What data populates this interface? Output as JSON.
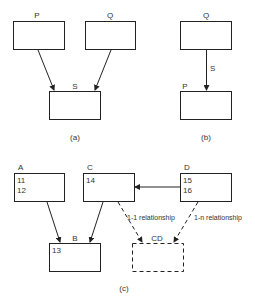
{
  "diagram_a": {
    "caption": "(a)",
    "boxes": {
      "p": "P",
      "q": "Q",
      "s": "S"
    }
  },
  "diagram_b": {
    "caption": "(b)",
    "boxes": {
      "q": "Q",
      "p": "P"
    },
    "edge_label": "S"
  },
  "diagram_c": {
    "caption": "(c)",
    "boxes": {
      "a": {
        "label": "A",
        "lines": [
          "11",
          "12"
        ]
      },
      "c": {
        "label": "C",
        "lines": [
          "14"
        ]
      },
      "d": {
        "label": "D",
        "lines": [
          "15",
          "16"
        ]
      },
      "b": {
        "label": "B",
        "lines": [
          "13"
        ]
      },
      "cd": {
        "label": "CD",
        "lines": []
      }
    },
    "edge_labels": {
      "c_cd": "1-1 relationship",
      "d_cd": "1-n relationship"
    }
  }
}
